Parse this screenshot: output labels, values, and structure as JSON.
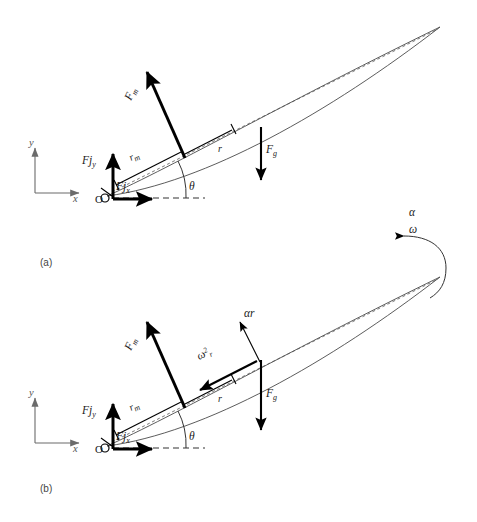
{
  "figure": {
    "background_color": "#ffffff",
    "ink_color": "#1a1a1a",
    "outline_color": "#4a4a4a"
  },
  "panels": [
    {
      "id": "a",
      "caption": "(a)",
      "description": "Static free-body diagram of limb segment",
      "coordinate_frame": {
        "y_label": "y",
        "x_label": "x"
      },
      "origin_label": "O",
      "angle_label": "θ",
      "vectors": [
        {
          "name": "muscle-force",
          "label_base": "F",
          "label_sub": "m",
          "label_full": "Fm",
          "description": "Muscle force, perpendicular to limb axis"
        },
        {
          "name": "joint-reaction-vertical",
          "label_base": "Fj",
          "label_sub": "y",
          "label_full": "Fjy",
          "description": "Vertical joint reaction force"
        },
        {
          "name": "joint-reaction-horizontal",
          "label_base": "Fj",
          "label_sub": "x",
          "label_full": "Fjx",
          "description": "Horizontal joint reaction force"
        },
        {
          "name": "gravity-force",
          "label_base": "F",
          "label_sub": "g",
          "label_full": "Fg",
          "description": "Gravitational force at centre of mass"
        }
      ],
      "dimensions": [
        {
          "name": "muscle-moment-arm",
          "label_base": "r",
          "label_sub": "m",
          "label_full": "rm",
          "description": "Moment arm of muscle force"
        },
        {
          "name": "centre-of-mass-distance",
          "label_base": "r",
          "label_sub": "",
          "label_full": "r",
          "description": "Distance from joint to centre of mass"
        }
      ]
    },
    {
      "id": "b",
      "caption": "(b)",
      "description": "Free-body diagram including angular acceleration terms",
      "coordinate_frame": {
        "y_label": "y",
        "x_label": "x"
      },
      "origin_label": "O",
      "angle_label": "θ",
      "rotation": {
        "angular_acceleration_label": "α",
        "angular_velocity_label": "ω"
      },
      "vectors": [
        {
          "name": "muscle-force",
          "label_base": "F",
          "label_sub": "m",
          "label_full": "Fm",
          "description": "Muscle force, perpendicular to limb axis"
        },
        {
          "name": "joint-reaction-vertical",
          "label_base": "Fj",
          "label_sub": "y",
          "label_full": "Fjy",
          "description": "Vertical joint reaction force"
        },
        {
          "name": "joint-reaction-horizontal",
          "label_base": "Fj",
          "label_sub": "x",
          "label_full": "Fjx",
          "description": "Horizontal joint reaction force"
        },
        {
          "name": "gravity-force",
          "label_base": "F",
          "label_sub": "g",
          "label_full": "Fg",
          "description": "Gravitational force at centre of mass"
        },
        {
          "name": "tangential-acceleration",
          "label_base": "α",
          "label_sub": "r",
          "label_full": "αr",
          "description": "Tangential acceleration term"
        },
        {
          "name": "centripetal-acceleration",
          "label_base": "ω",
          "label_sup": "2",
          "label_sub": "r",
          "label_full": "ω²r",
          "description": "Centripetal acceleration term"
        }
      ],
      "dimensions": [
        {
          "name": "muscle-moment-arm",
          "label_base": "r",
          "label_sub": "m",
          "label_full": "rm",
          "description": "Moment arm of muscle force"
        },
        {
          "name": "centre-of-mass-distance",
          "label_base": "r",
          "label_sub": "",
          "label_full": "r",
          "description": "Distance from joint to centre of mass"
        }
      ]
    }
  ],
  "symbols": {
    "theta": "θ",
    "alpha": "α",
    "omega": "ω",
    "superscript_two": "2"
  }
}
